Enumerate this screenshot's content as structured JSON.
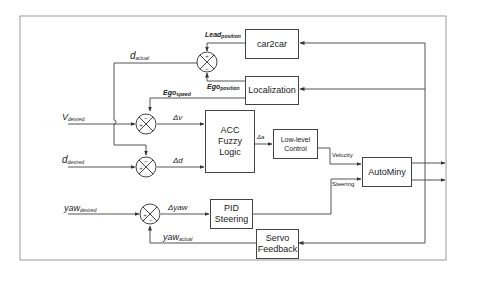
{
  "diagram": {
    "type": "control-block-diagram",
    "blocks": {
      "car2car": "car2car",
      "localization": "Localization",
      "acc_line1": "ACC",
      "acc_line2": "Fuzzy Logic",
      "lowlevel_line1": "Low-level",
      "lowlevel_line2": "Control",
      "autominy": "AutoMiny",
      "pid_line1": "PID",
      "pid_line2": "Steering",
      "servo_line1": "Servo",
      "servo_line2": "Feedback"
    },
    "signals": {
      "lead_position": {
        "main": "Lead",
        "sub": "position"
      },
      "ego_position": {
        "main": "Ego",
        "sub": "position"
      },
      "d_actual": {
        "main": "d",
        "sub": "actual"
      },
      "ego_speed": {
        "main": "Ego",
        "sub": "speed"
      },
      "v_desired": {
        "main": "V",
        "sub": "desired"
      },
      "d_desired": {
        "main": "d",
        "sub": "desired"
      },
      "yaw_desired": {
        "main": "yaw",
        "sub": "desired"
      },
      "yaw_actual": {
        "main": "yaw",
        "sub": "actual"
      },
      "delta_v": "Δv",
      "delta_d": "Δd",
      "delta_a": "Δa",
      "delta_yaw": "Δyaw",
      "velocity": "Velocity",
      "steering": "Steering"
    },
    "summers": {
      "top": {
        "top": "+",
        "bottom": "−"
      },
      "dv": {
        "top": "−",
        "left": "+"
      },
      "dd": {
        "top": "−",
        "left": "+"
      },
      "yaw": {
        "left": "+",
        "bottom": "−"
      }
    }
  }
}
